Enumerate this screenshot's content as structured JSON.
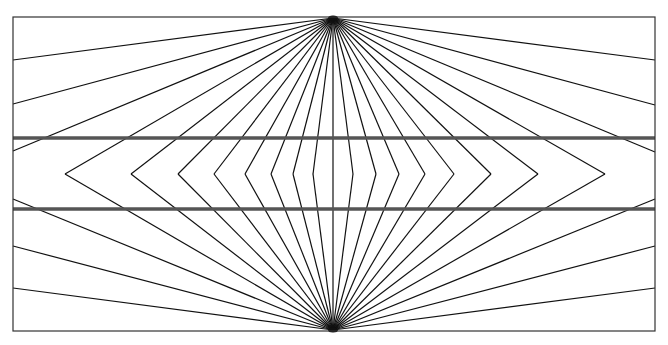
{
  "figure": {
    "width": 668,
    "height": 345,
    "background": "#ffffff",
    "frame": {
      "x1": 13,
      "y1": 17,
      "x2": 655,
      "y2": 331,
      "color": "#333333",
      "stroke": 1.2
    },
    "apex_top": {
      "x": 333,
      "y": 18
    },
    "apex_bottom": {
      "x": 333,
      "y": 330
    },
    "midline_y": 174,
    "ray_color": "#111111",
    "ray_stroke": 1.2,
    "chevron_vertices_x": [
      65,
      131,
      178,
      214,
      245,
      271,
      293,
      313,
      333,
      353,
      376,
      399,
      425,
      454,
      491,
      538,
      605
    ],
    "edge_rays": {
      "left_top_y": [
        60,
        104,
        151
      ],
      "left_bottom_y": [
        199,
        246,
        288
      ],
      "right_top_y": [
        60,
        105,
        152
      ],
      "right_bottom_y": [
        199,
        246,
        288
      ]
    },
    "horizontal_lines": [
      {
        "y": 138,
        "color": "#555555",
        "stroke": 3.5
      },
      {
        "y": 209,
        "color": "#555555",
        "stroke": 3.5
      }
    ]
  }
}
